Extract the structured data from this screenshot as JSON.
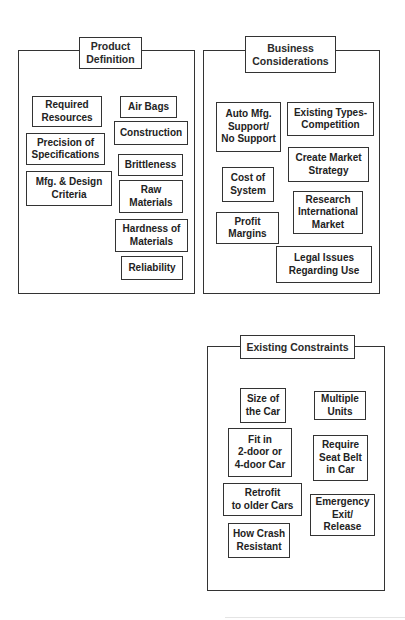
{
  "panels": [
    {
      "title": "Product\nDefinition",
      "items": [
        "Required\nResources",
        "Air Bags",
        "Construction",
        "Precision of\nSpecifications",
        "Brittleness",
        "Mfg. & Design\nCriteria",
        "Raw\nMaterials",
        "Hardness of\nMaterials",
        "Reliability"
      ]
    },
    {
      "title": "Business\nConsiderations",
      "items": [
        "Auto Mfg.\nSupport/\nNo Support",
        "Existing Types-\nCompetition",
        "Create Market\nStrategy",
        "Cost of\nSystem",
        "Research\nInternational\nMarket",
        "Profit\nMargins",
        "Legal Issues\nRegarding Use"
      ]
    },
    {
      "title": "Existing Constraints",
      "items": [
        "Size of\nthe Car",
        "Multiple\nUnits",
        "Fit in\n2-door or\n4-door Car",
        "Require\nSeat Belt\nin Car",
        "Retrofit\nto older Cars",
        "Emergency\nExit/\nRelease",
        "How Crash\nResistant"
      ]
    }
  ]
}
